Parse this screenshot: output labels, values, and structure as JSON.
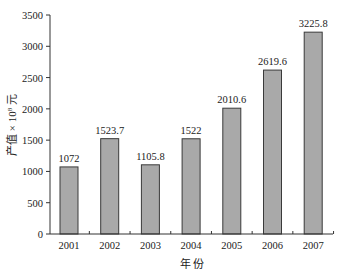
{
  "chart_data": {
    "type": "bar",
    "title": "",
    "xlabel": "年 份",
    "ylabel": "产值 × 10⁸ 元",
    "ylabel_parts": {
      "main": "产值 × 10",
      "sup": "8",
      "unit": " 元"
    },
    "categories": [
      "2001",
      "2002",
      "2003",
      "2004",
      "2005",
      "2006",
      "2007"
    ],
    "values": [
      1072,
      1523.7,
      1105.8,
      1522,
      2010.6,
      2619.6,
      3225.8
    ],
    "value_labels": [
      "1072",
      "1523.7",
      "1105.8",
      "1522",
      "2010.6",
      "2619.6",
      "3225.8"
    ],
    "ylim": [
      0,
      3500
    ],
    "yticks": [
      0,
      500,
      1000,
      1500,
      2000,
      2500,
      3000,
      3500
    ],
    "grid": false,
    "legend": null,
    "colors": {
      "bar_fill": "#a9a9a9",
      "bar_edge": "#3a3a3a",
      "axis": "#333333"
    }
  }
}
